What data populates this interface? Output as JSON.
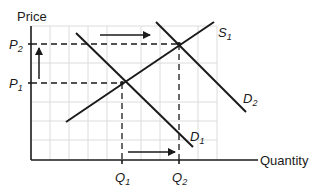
{
  "diagram": {
    "type": "supply-demand",
    "y_axis_label": "Price",
    "x_axis_label": "Quantity",
    "price_levels": [
      {
        "id": "P2",
        "main": "P",
        "sub": "2"
      },
      {
        "id": "P1",
        "main": "P",
        "sub": "1"
      }
    ],
    "quantity_levels": [
      {
        "id": "Q1",
        "main": "Q",
        "sub": "1"
      },
      {
        "id": "Q2",
        "main": "Q",
        "sub": "2"
      }
    ],
    "curves": [
      {
        "id": "S1",
        "main": "S",
        "sub": "1",
        "kind": "supply"
      },
      {
        "id": "D1",
        "main": "D",
        "sub": "1",
        "kind": "demand"
      },
      {
        "id": "D2",
        "main": "D",
        "sub": "2",
        "kind": "demand"
      }
    ],
    "equilibria": [
      {
        "price": "P1",
        "quantity": "Q1",
        "curves": [
          "S1",
          "D1"
        ]
      },
      {
        "price": "P2",
        "quantity": "Q2",
        "curves": [
          "S1",
          "D2"
        ]
      }
    ],
    "shift_arrows": [
      {
        "id": "demand-shift-arrow",
        "direction": "right"
      },
      {
        "id": "price-increase-arrow",
        "direction": "up"
      },
      {
        "id": "quantity-increase-arrow",
        "direction": "right"
      }
    ],
    "colors": {
      "ink": "#1a1a1a",
      "grid": "#d9d9d9",
      "background": "#ffffff"
    }
  }
}
